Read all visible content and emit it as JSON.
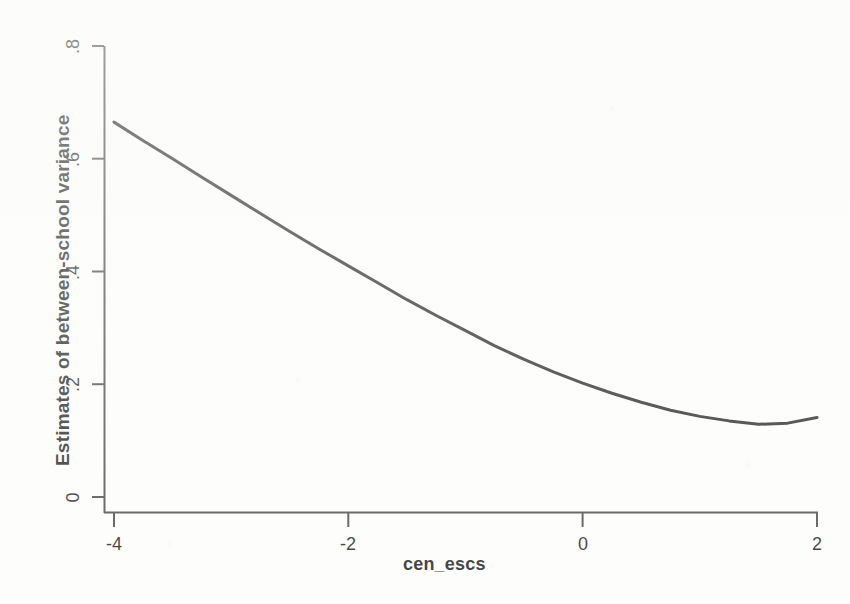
{
  "chart_data": {
    "type": "line",
    "title": "",
    "subtitle": "",
    "xlabel": "cen_escs",
    "ylabel": "Estimates of between-school variance",
    "xlim": [
      -4,
      2
    ],
    "ylim": [
      0,
      0.8
    ],
    "xticks": [
      "-4",
      "-2",
      "0",
      "2"
    ],
    "xtick_values": [
      -4,
      -2,
      0,
      2
    ],
    "yticks": [
      "0",
      ".2",
      ".4",
      ".6",
      ".8"
    ],
    "ytick_values": [
      0,
      0.2,
      0.4,
      0.6,
      0.8
    ],
    "grid": false,
    "legend": null,
    "legend_position": "none",
    "line_color": "#111111",
    "line_width": 3,
    "background_color": "#fdfdfc",
    "axis_color": "#333333",
    "series": [
      {
        "name": "Estimates of between-school variance",
        "x": [
          -4.0,
          -3.75,
          -3.5,
          -3.25,
          -3.0,
          -2.75,
          -2.5,
          -2.25,
          -2.0,
          -1.75,
          -1.5,
          -1.25,
          -1.0,
          -0.75,
          -0.5,
          -0.25,
          0.0,
          0.25,
          0.5,
          0.75,
          1.0,
          1.25,
          1.5,
          1.75,
          2.0
        ],
        "values": [
          0.665,
          0.632,
          0.6,
          0.567,
          0.535,
          0.503,
          0.471,
          0.44,
          0.41,
          0.38,
          0.35,
          0.322,
          0.295,
          0.268,
          0.244,
          0.222,
          0.202,
          0.184,
          0.168,
          0.154,
          0.143,
          0.135,
          0.129,
          0.131,
          0.141
        ]
      }
    ],
    "annotations": []
  },
  "figure": {
    "axis_title_x": "cen_escs",
    "axis_title_y": "Estimates of between-school variance"
  }
}
